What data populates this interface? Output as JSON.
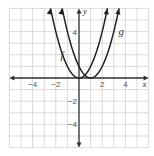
{
  "chart_data": {
    "type": "line",
    "title": "",
    "xlabel": "x",
    "ylabel": "y",
    "xlim": [
      -6,
      6
    ],
    "ylim": [
      -6,
      6
    ],
    "grid": true,
    "x_ticks": [
      -4,
      -2,
      2,
      4
    ],
    "y_ticks": [
      4,
      -2,
      -4
    ],
    "x_tick_labels": [
      "−4",
      "−2",
      "2",
      "4"
    ],
    "y_tick_labels": [
      "4",
      "−2",
      "−4"
    ],
    "series": [
      {
        "name": "f",
        "expression": "x^2",
        "vertex": [
          0,
          0
        ],
        "x_range": [
          -2.45,
          2.45
        ]
      },
      {
        "name": "g",
        "expression": "(x-1)^2",
        "vertex": [
          1,
          0
        ],
        "x_range": [
          -1.45,
          3.45
        ]
      }
    ],
    "labels": {
      "f": "f",
      "g": "g"
    },
    "colors": {
      "curve": "#222222",
      "axis": "#333333",
      "grid": "#cccccc"
    }
  }
}
